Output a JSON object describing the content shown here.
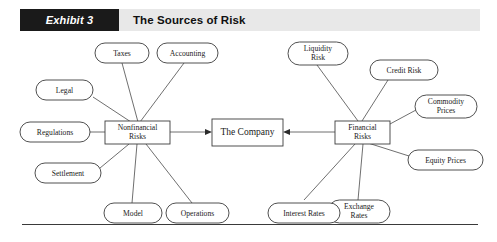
{
  "header": {
    "tag": "Exhibit 3",
    "title": "The Sources of Risk"
  },
  "diagram": {
    "type": "radial-node-diagram",
    "center_node": {
      "label": "The Company",
      "shape": "rect"
    },
    "hub_nodes": [
      {
        "id": "nonfinancial",
        "label_line1": "Nonfinancial",
        "label_line2": "Risks",
        "shape": "rect"
      },
      {
        "id": "financial",
        "label_line1": "Financial",
        "label_line2": "Risks",
        "shape": "rect"
      }
    ],
    "nonfinancial_sources": [
      {
        "id": "taxes",
        "label_line1": "Taxes",
        "label_line2": ""
      },
      {
        "id": "accounting",
        "label_line1": "Accounting",
        "label_line2": ""
      },
      {
        "id": "legal",
        "label_line1": "Legal",
        "label_line2": ""
      },
      {
        "id": "regulations",
        "label_line1": "Regulations",
        "label_line2": ""
      },
      {
        "id": "settlement",
        "label_line1": "Settlement",
        "label_line2": ""
      },
      {
        "id": "model",
        "label_line1": "Model",
        "label_line2": ""
      },
      {
        "id": "operations",
        "label_line1": "Operations",
        "label_line2": ""
      }
    ],
    "financial_sources": [
      {
        "id": "liquidity-risk",
        "label_line1": "Liquidity",
        "label_line2": "Risk"
      },
      {
        "id": "credit-risk",
        "label_line1": "Credit Risk",
        "label_line2": ""
      },
      {
        "id": "commodity-prices",
        "label_line1": "Commodity",
        "label_line2": "Prices"
      },
      {
        "id": "equity-prices",
        "label_line1": "Equity Prices",
        "label_line2": ""
      },
      {
        "id": "exchange-rates",
        "label_line1": "Exchange",
        "label_line2": "Rates"
      },
      {
        "id": "interest-rates",
        "label_line1": "Interest Rates",
        "label_line2": ""
      }
    ],
    "flow_labels": {
      "nonfinancial_to_company": "Nonfinancial Risks → The Company",
      "financial_to_company": "Financial Risks → The Company"
    }
  },
  "colors": {
    "tag_background": "#1a1a1a",
    "tag_text": "#ffffff",
    "band_background": "#e8e8e8",
    "title_text": "#101010",
    "node_stroke": "#3c3c3c",
    "node_fill": "#ffffff",
    "edge_stroke": "#4a4a4a",
    "rule": "#3a3a3a"
  }
}
